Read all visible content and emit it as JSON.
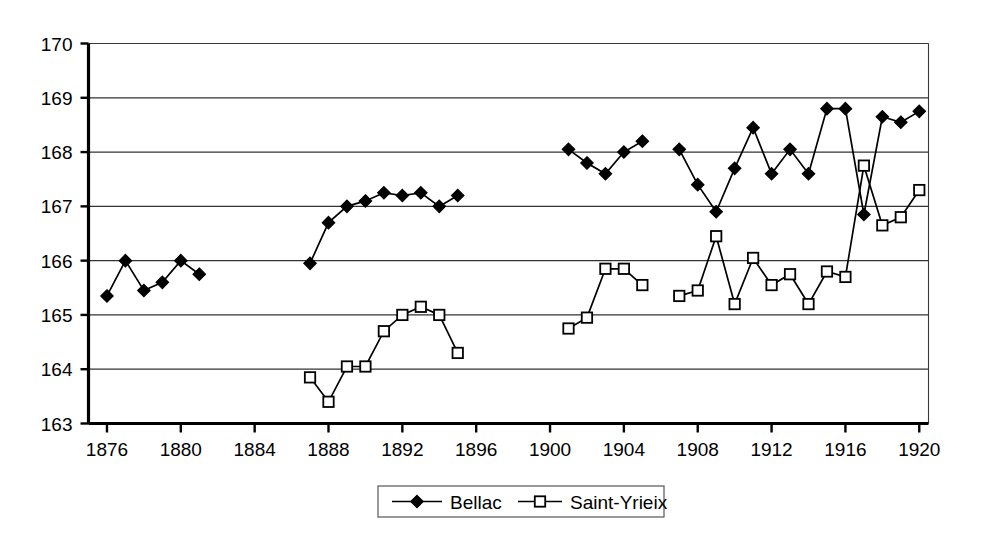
{
  "chart_data": {
    "type": "line",
    "title": "",
    "subtitle": "",
    "xlabel": "",
    "ylabel": "",
    "xlim": [
      1875,
      1920.5
    ],
    "ylim": [
      163,
      170
    ],
    "xticks": [
      1876,
      1880,
      1884,
      1888,
      1892,
      1896,
      1900,
      1904,
      1908,
      1912,
      1916,
      1920
    ],
    "yticks": [
      163,
      164,
      165,
      166,
      167,
      168,
      169,
      170
    ],
    "xtick_labels": [
      "1876",
      "1880",
      "1884",
      "1888",
      "1892",
      "1896",
      "1900",
      "1904",
      "1908",
      "1912",
      "1916",
      "1920"
    ],
    "ytick_labels": [
      "163",
      "164",
      "165",
      "166",
      "167",
      "168",
      "169",
      "170"
    ],
    "grid": "horizontal",
    "legend_position": "bottom-center",
    "series": [
      {
        "name": "Bellac",
        "marker": "filled-diamond",
        "color": "#000000",
        "segments": [
          {
            "x": [
              1876,
              1877,
              1878,
              1879,
              1880,
              1881
            ],
            "y": [
              165.35,
              166.0,
              165.45,
              165.6,
              166.0,
              165.75
            ]
          },
          {
            "x": [
              1887,
              1888,
              1889,
              1890,
              1891,
              1892,
              1893,
              1894,
              1895
            ],
            "y": [
              165.95,
              166.7,
              167.0,
              167.1,
              167.25,
              167.2,
              167.25,
              167.0,
              167.2
            ]
          },
          {
            "x": [
              1901,
              1902,
              1903,
              1904,
              1905
            ],
            "y": [
              168.05,
              167.8,
              167.6,
              168.0,
              168.2
            ]
          },
          {
            "x": [
              1907,
              1908,
              1909,
              1910,
              1911,
              1912,
              1913,
              1914,
              1915,
              1916,
              1917,
              1918,
              1919,
              1920
            ],
            "y": [
              168.05,
              167.4,
              166.9,
              167.7,
              168.45,
              167.6,
              168.05,
              167.6,
              168.8,
              168.8,
              166.85,
              168.65,
              168.55,
              168.75
            ]
          }
        ]
      },
      {
        "name": "Saint-Yrieix",
        "marker": "open-square",
        "color": "#000000",
        "segments": [
          {
            "x": [
              1887,
              1888,
              1889,
              1890,
              1891,
              1892,
              1893,
              1894,
              1895
            ],
            "y": [
              163.85,
              163.4,
              164.05,
              164.05,
              164.7,
              165.0,
              165.15,
              165.0,
              164.3
            ]
          },
          {
            "x": [
              1901,
              1902,
              1903,
              1904,
              1905
            ],
            "y": [
              164.75,
              164.95,
              165.85,
              165.85,
              165.55
            ]
          },
          {
            "x": [
              1907,
              1908,
              1909,
              1910,
              1911,
              1912,
              1913,
              1914,
              1915,
              1916,
              1917,
              1918,
              1919,
              1920
            ],
            "y": [
              165.35,
              165.45,
              166.45,
              165.2,
              166.05,
              165.55,
              165.75,
              165.2,
              165.8,
              165.7,
              167.75,
              166.65,
              166.8,
              167.3
            ]
          }
        ]
      }
    ]
  },
  "legend": {
    "entries": [
      {
        "label": "Bellac",
        "marker": "filled-diamond"
      },
      {
        "label": "Saint-Yrieix",
        "marker": "open-square"
      }
    ]
  },
  "colors": {
    "axis": "#000000",
    "grid": "#333333",
    "background": "#ffffff",
    "series_bellac": "#000000",
    "series_saint_yrieix": "#000000"
  }
}
